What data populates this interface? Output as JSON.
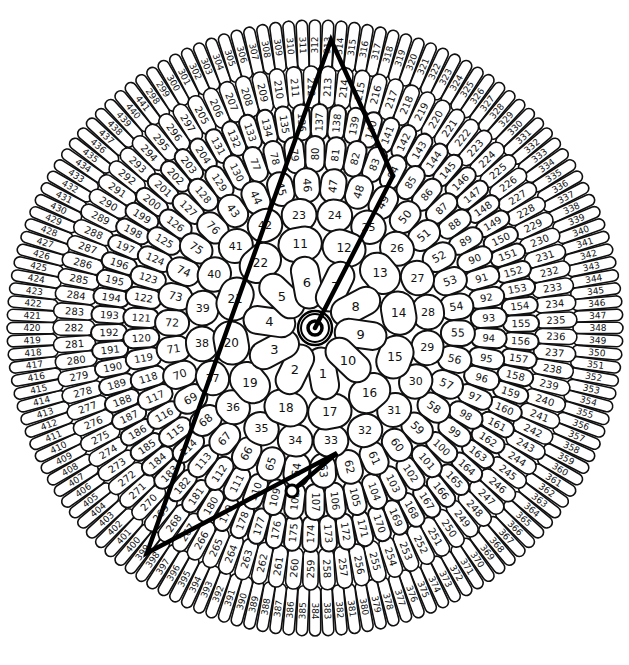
{
  "puzzle": {
    "caption_partial": "",
    "center": {
      "x": 315,
      "y": 328
    },
    "outer_radius": 308,
    "colors": {
      "stroke": "#111111",
      "fill": "#ffffff",
      "path": "#000000",
      "background": "#ffffff"
    },
    "rings": [
      {
        "start": 1,
        "end": 10,
        "r_in": 22,
        "r_out": 70,
        "label_r": 50,
        "font": 13,
        "offset_deg": 80
      },
      {
        "start": 11,
        "end": 22,
        "r_in": 70,
        "r_out": 100,
        "label_r": 87,
        "font": 12,
        "offset_deg": -100
      },
      {
        "start": 23,
        "end": 42,
        "r_in": 100,
        "r_out": 128,
        "label_r": 114,
        "font": 11,
        "offset_deg": -98
      },
      {
        "start": 43,
        "end": 76,
        "r_in": 128,
        "r_out": 158,
        "label_r": 143,
        "font": 11,
        "offset_deg": -125
      },
      {
        "start": 77,
        "end": 130,
        "r_in": 158,
        "r_out": 190,
        "label_r": 174,
        "font": 10,
        "offset_deg": -110
      },
      {
        "start": 131,
        "end": 204,
        "r_in": 190,
        "r_out": 222,
        "label_r": 206,
        "font": 10,
        "offset_deg": -118
      },
      {
        "start": 205,
        "end": 297,
        "r_in": 222,
        "r_out": 260,
        "label_r": 241,
        "font": 10,
        "offset_deg": -118
      },
      {
        "start": 298,
        "end": 441,
        "r_in": 260,
        "r_out": 306,
        "label_r": 283,
        "font": 9,
        "offset_deg": -125
      }
    ],
    "drawn_path": {
      "points": [
        [
          315,
          328
        ],
        [
          393,
          176
        ],
        [
          331,
          40
        ],
        [
          147,
          553
        ],
        [
          337,
          453
        ],
        [
          292,
          491
        ]
      ],
      "visited_labels": [
        "start",
        "86",
        "317",
        "402",
        "62",
        "end"
      ]
    },
    "start_marker": {
      "outer_r": 17,
      "inner_r": 14,
      "dot_r": 7
    },
    "end_marker": {
      "x": 292,
      "y": 491,
      "r": 6
    }
  }
}
